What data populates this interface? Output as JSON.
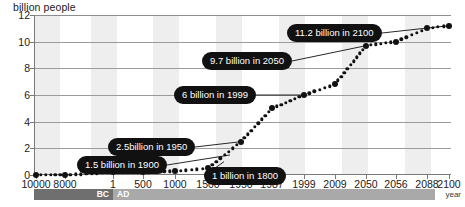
{
  "chart_data": {
    "type": "line",
    "title": "",
    "ylabel": "billion people",
    "xlabel": "year",
    "ylim": [
      0,
      12
    ],
    "y_ticks": [
      "0",
      "2",
      "4",
      "6",
      "8",
      "10",
      "12"
    ],
    "grid": true,
    "legend": false,
    "x_ticks": [
      "10000",
      "8000",
      "1",
      "500",
      "1000",
      "1500",
      "1950",
      "1987",
      "1999",
      "2009",
      "2050",
      "2056",
      "2088",
      "2100"
    ],
    "x_tick_labels_note": "categorical / unevenly spaced time axis",
    "series": [
      {
        "name": "World population",
        "points": [
          {
            "x": "10000",
            "y": 0.0
          },
          {
            "x": "8000",
            "y": 0.0
          },
          {
            "x": "1",
            "y": 0.2
          },
          {
            "x": "500",
            "y": 0.2
          },
          {
            "x": "1000",
            "y": 0.3
          },
          {
            "x": "1500",
            "y": 0.5
          },
          {
            "x": "1950",
            "y": 2.5
          },
          {
            "x": "1987",
            "y": 5.0
          },
          {
            "x": "1999",
            "y": 6.0
          },
          {
            "x": "2009",
            "y": 6.8
          },
          {
            "x": "2050",
            "y": 9.7
          },
          {
            "x": "2056",
            "y": 10.0
          },
          {
            "x": "2088",
            "y": 11.0
          },
          {
            "x": "2100",
            "y": 11.2
          }
        ]
      }
    ],
    "annotations": [
      {
        "label": "11.2 billion in 2100",
        "value": 11.2,
        "year": "2100"
      },
      {
        "label": "9.7 billion in 2050",
        "value": 9.7,
        "year": "2050"
      },
      {
        "label": "6 billion in 1999",
        "value": 6,
        "year": "1999"
      },
      {
        "label": "2.5billion in 1950",
        "value": 2.5,
        "year": "1950"
      },
      {
        "label": "1.5 billion in 1900",
        "value": 1.5,
        "year": "1900"
      },
      {
        "label": "1 billion in 1800",
        "value": 1,
        "year": "1800"
      }
    ],
    "era_bar": [
      {
        "label": "BC",
        "color": "#6f6f6f"
      },
      {
        "label": "AD",
        "color": "#a9a9a9"
      }
    ],
    "colors": {
      "line": "#111111",
      "marker": "#111111",
      "callout_bg": "#111111",
      "callout_text": "#ffffff",
      "band": "#eeeeee",
      "grid": "#9b9b9b"
    }
  }
}
